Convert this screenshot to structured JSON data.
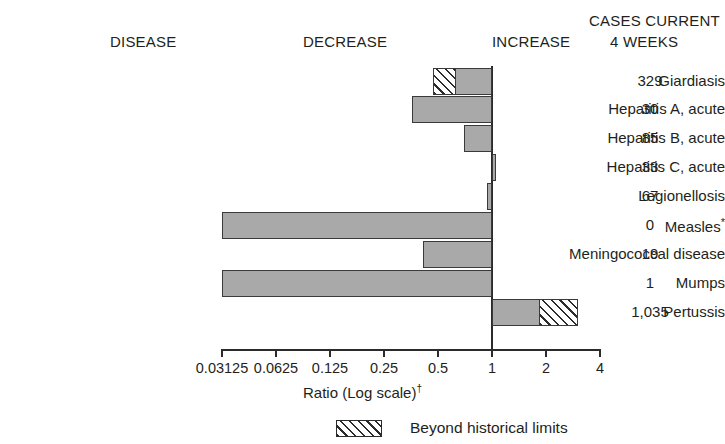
{
  "headers": {
    "disease": "DISEASE",
    "decrease": "DECREASE",
    "increase": "INCREASE",
    "cases_line1": "CASES CURRENT",
    "cases_line2": "4 WEEKS"
  },
  "axis": {
    "title": "Ratio (Log scale)",
    "title_footnote": "†",
    "tick_labels": [
      "0.03125",
      "0.0625",
      "0.125",
      "0.25",
      "0.5",
      "1",
      "2",
      "4"
    ],
    "tick_values": [
      0.03125,
      0.0625,
      0.125,
      0.25,
      0.5,
      1,
      2,
      4
    ],
    "baseline_value": 1,
    "scale": "log2"
  },
  "legend": {
    "label": "Beyond historical limits",
    "swatch": "hatched-swatch"
  },
  "colors": {
    "bar_fill": "#a9a9a9",
    "bar_border": "#3a3a3a",
    "hatch_line": "#2b2b2b",
    "hatch_background": "#ffffff",
    "text": "#231f20",
    "axis": "#2b2b2b"
  },
  "chart_data": {
    "type": "bar",
    "orientation": "horizontal",
    "title": "",
    "xlabel": "Ratio (Log scale)†",
    "ylabel": "DISEASE",
    "xscale": "log",
    "xlim": [
      0.03125,
      4
    ],
    "xticks": [
      0.03125,
      0.0625,
      0.125,
      0.25,
      0.5,
      1,
      2,
      4
    ],
    "xticklabels": [
      "0.03125",
      "0.0625",
      "0.125",
      "0.25",
      "0.5",
      "1",
      "2",
      "4"
    ],
    "reference_line": 1,
    "grid": false,
    "legend": [
      "Beyond historical limits"
    ],
    "legend_position": "bottom-center",
    "categories": [
      "Giardiasis",
      "Hepatitis A, acute",
      "Hepatitis B, acute",
      "Hepatitis C, acute",
      "Legionellosis",
      "Measles*",
      "Meningococcal disease",
      "Mumps",
      "Pertussis"
    ],
    "values": [
      0.47,
      0.36,
      0.7,
      1.05,
      0.94,
      0.03125,
      0.41,
      0.03125,
      3.0
    ],
    "beyond_historical_limits": [
      true,
      false,
      false,
      false,
      false,
      false,
      false,
      false,
      true
    ],
    "beyond_limits_threshold": [
      0.62,
      null,
      null,
      null,
      null,
      null,
      null,
      null,
      1.84
    ],
    "truncated_at_axis_end": [
      false,
      false,
      false,
      false,
      false,
      true,
      false,
      true,
      false
    ],
    "cases_current_4_weeks": [
      "329",
      "30",
      "85",
      "33",
      "67",
      "0",
      "19",
      "1",
      "1,035"
    ]
  },
  "rows": [
    {
      "disease": "Giardiasis",
      "disease_footnote": "",
      "count": "329",
      "ratio": 0.47,
      "hatch_from": 0.47,
      "hatch_to": 0.62,
      "solid_from": 0.62,
      "solid_to": 1,
      "side": "decrease"
    },
    {
      "disease": "Hepatitis A, acute",
      "disease_footnote": "",
      "count": "30",
      "ratio": 0.36,
      "hatch_from": null,
      "hatch_to": null,
      "solid_from": 0.36,
      "solid_to": 1,
      "side": "decrease"
    },
    {
      "disease": "Hepatitis B, acute",
      "disease_footnote": "",
      "count": "85",
      "ratio": 0.7,
      "hatch_from": null,
      "hatch_to": null,
      "solid_from": 0.7,
      "solid_to": 1,
      "side": "decrease"
    },
    {
      "disease": "Hepatitis C, acute",
      "disease_footnote": "",
      "count": "33",
      "ratio": 1.05,
      "hatch_from": null,
      "hatch_to": null,
      "solid_from": 1,
      "solid_to": 1.05,
      "side": "increase"
    },
    {
      "disease": "Legionellosis",
      "disease_footnote": "",
      "count": "67",
      "ratio": 0.94,
      "hatch_from": null,
      "hatch_to": null,
      "solid_from": 0.94,
      "solid_to": 1,
      "side": "decrease"
    },
    {
      "disease": "Measles",
      "disease_footnote": "*",
      "count": "0",
      "ratio": 0.03125,
      "hatch_from": null,
      "hatch_to": null,
      "solid_from": 0.03125,
      "solid_to": 1,
      "side": "decrease"
    },
    {
      "disease": "Meningococcal disease",
      "disease_footnote": "",
      "count": "19",
      "ratio": 0.41,
      "hatch_from": null,
      "hatch_to": null,
      "solid_from": 0.41,
      "solid_to": 1,
      "side": "decrease"
    },
    {
      "disease": "Mumps",
      "disease_footnote": "",
      "count": "1",
      "ratio": 0.03125,
      "hatch_from": null,
      "hatch_to": null,
      "solid_from": 0.03125,
      "solid_to": 1,
      "side": "decrease"
    },
    {
      "disease": "Pertussis",
      "disease_footnote": "",
      "count": "1,035",
      "ratio": 3.0,
      "hatch_from": 1.84,
      "hatch_to": 3.0,
      "solid_from": 1,
      "solid_to": 1.84,
      "side": "increase"
    }
  ]
}
